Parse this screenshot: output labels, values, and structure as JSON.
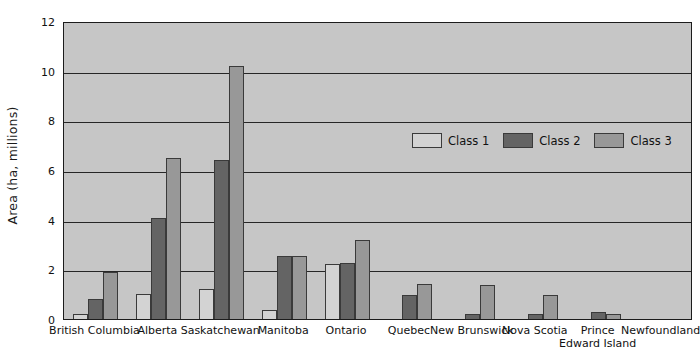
{
  "chart_data": {
    "type": "bar",
    "title": "",
    "xlabel": "",
    "ylabel": "Area (ha, millions)",
    "ylim": [
      0,
      12
    ],
    "ytick_labels": [
      "0",
      "2",
      "4",
      "6",
      "8",
      "10",
      "12"
    ],
    "yticks": [
      0,
      2,
      4,
      6,
      8,
      10,
      12
    ],
    "grid": true,
    "legend_position": "upper right inside",
    "categories": [
      "British Columbia",
      "Alberta",
      "Saskatchewan",
      "Manitoba",
      "Ontario",
      "Quebec",
      "New Brunswick",
      "Nova Scotia",
      "Prince Edward Island",
      "Newfoundland"
    ],
    "series": [
      {
        "name": "Class 1",
        "color": "#d3d3d3",
        "values": [
          0.2,
          1.0,
          1.2,
          0.35,
          2.2,
          0.0,
          0.0,
          0.0,
          0.0,
          0.0
        ]
      },
      {
        "name": "Class 2",
        "color": "#646464",
        "values": [
          0.8,
          4.05,
          6.4,
          2.55,
          2.25,
          0.95,
          0.2,
          0.2,
          0.3,
          0.0
        ]
      },
      {
        "name": "Class 3",
        "color": "#989898",
        "values": [
          1.9,
          6.5,
          10.2,
          2.55,
          3.2,
          1.4,
          1.35,
          0.95,
          0.2,
          0.0
        ]
      }
    ]
  },
  "legend": {
    "items": [
      {
        "label": "Class 1",
        "swatch": "c1"
      },
      {
        "label": "Class 2",
        "swatch": "c2"
      },
      {
        "label": "Class 3",
        "swatch": "c3"
      }
    ]
  },
  "axes": {
    "y_title": "Area (ha, millions)"
  },
  "x_labels": [
    {
      "line1": "British Columbia",
      "line2": ""
    },
    {
      "line1": "Alberta",
      "line2": ""
    },
    {
      "line1": "Saskatchewan",
      "line2": ""
    },
    {
      "line1": "Manitoba",
      "line2": ""
    },
    {
      "line1": "Ontario",
      "line2": ""
    },
    {
      "line1": "Quebec",
      "line2": ""
    },
    {
      "line1": "New Brunswick",
      "line2": ""
    },
    {
      "line1": "Nova Scotia",
      "line2": ""
    },
    {
      "line1": "Prince",
      "line2": "Edward Island"
    },
    {
      "line1": "Newfoundland",
      "line2": ""
    }
  ],
  "colors": {
    "plot_background": "#c6c6c6",
    "frame": "#1c1c1c",
    "gridline": "#262626",
    "class1": "#d3d3d3",
    "class2": "#646464",
    "class3": "#989898",
    "text": "#111111"
  }
}
